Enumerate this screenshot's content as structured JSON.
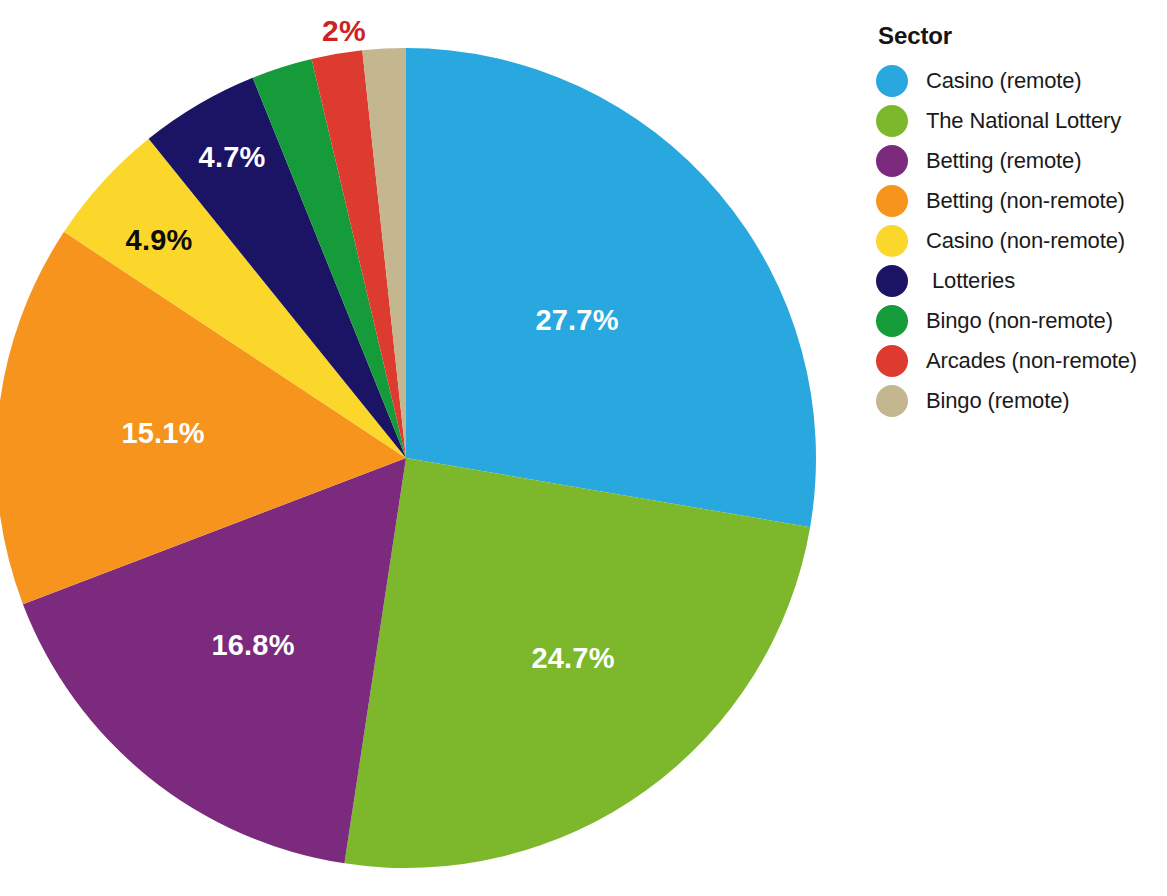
{
  "legend": {
    "title": "Sector",
    "position": "right",
    "items": [
      {
        "label": "Casino (remote)",
        "color": "#29a8e0",
        "indented": false
      },
      {
        "label": "The National Lottery",
        "color": "#7cb72c",
        "indented": false
      },
      {
        "label": "Betting (remote)",
        "color": "#7b2a7d",
        "indented": false
      },
      {
        "label": "Betting (non-remote)",
        "color": "#f6941e",
        "indented": false
      },
      {
        "label": "Casino (non-remote)",
        "color": "#fbd72b",
        "indented": false
      },
      {
        "label": "Lotteries",
        "color": "#1b1464",
        "indented": true
      },
      {
        "label": "Bingo (non-remote)",
        "color": "#159b3a",
        "indented": false
      },
      {
        "label": "Arcades (non-remote)",
        "color": "#de3b30",
        "indented": false
      },
      {
        "label": "Bingo (remote)",
        "color": "#c4b68e",
        "indented": false
      }
    ]
  },
  "chart_data": {
    "type": "pie",
    "title": "",
    "legend_title": "Sector",
    "legend_position": "right",
    "start_angle_deg": 0,
    "direction": "clockwise",
    "categories": [
      "Casino (remote)",
      "The National Lottery",
      "Betting (remote)",
      "Betting (non-remote)",
      "Casino (non-remote)",
      "Lotteries",
      "Bingo (non-remote)",
      "Arcades (non-remote)",
      "Bingo (remote)"
    ],
    "values": [
      27.7,
      24.7,
      16.8,
      15.1,
      4.9,
      4.7,
      2.4,
      2.0,
      1.7
    ],
    "colors": [
      "#29a8e0",
      "#7cb72c",
      "#7b2a7d",
      "#f6941e",
      "#fbd72b",
      "#1b1464",
      "#159b3a",
      "#de3b30",
      "#c4b68e"
    ],
    "slices": [
      {
        "label": "Casino (remote)",
        "value": 27.7,
        "display": "27.7%",
        "color": "#29a8e0",
        "label_shown": true,
        "label_color": "#ffffff",
        "label_pos": "inside",
        "lx": 577,
        "ly": 320
      },
      {
        "label": "The National Lottery",
        "value": 24.7,
        "display": "24.7%",
        "color": "#7cb72c",
        "label_shown": true,
        "label_color": "#ffffff",
        "label_pos": "inside",
        "lx": 573,
        "ly": 658
      },
      {
        "label": "Betting (remote)",
        "value": 16.8,
        "display": "16.8%",
        "color": "#7b2a7d",
        "label_shown": true,
        "label_color": "#ffffff",
        "label_pos": "inside",
        "lx": 253,
        "ly": 645
      },
      {
        "label": "Betting (non-remote)",
        "value": 15.1,
        "display": "15.1%",
        "color": "#f6941e",
        "label_shown": true,
        "label_color": "#ffffff",
        "label_pos": "inside",
        "lx": 163,
        "ly": 433
      },
      {
        "label": "Casino (non-remote)",
        "value": 4.9,
        "display": "4.9%",
        "color": "#fbd72b",
        "label_shown": true,
        "label_color": "#0d0d0d",
        "label_pos": "inside",
        "lx": 159,
        "ly": 240
      },
      {
        "label": "Lotteries",
        "value": 4.7,
        "display": "4.7%",
        "color": "#1b1464",
        "label_shown": true,
        "label_color": "#ffffff",
        "label_pos": "inside",
        "lx": 232,
        "ly": 157
      },
      {
        "label": "Bingo (non-remote)",
        "value": 2.4,
        "display": "",
        "color": "#159b3a",
        "label_shown": false,
        "label_color": "",
        "label_pos": "none",
        "lx": 0,
        "ly": 0
      },
      {
        "label": "Arcades (non-remote)",
        "value": 2.0,
        "display": "2%",
        "color": "#de3b30",
        "label_shown": true,
        "label_color": "#cc2222",
        "label_pos": "outside",
        "lx": 344,
        "ly": 31
      },
      {
        "label": "Bingo (remote)",
        "value": 1.7,
        "display": "",
        "color": "#c4b68e",
        "label_shown": false,
        "label_color": "",
        "label_pos": "none",
        "lx": 0,
        "ly": 0
      }
    ],
    "geometry": {
      "cx": 406,
      "cy": 458,
      "r": 410
    }
  }
}
